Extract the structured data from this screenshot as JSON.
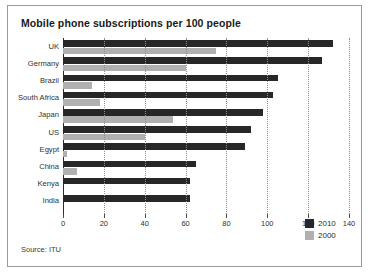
{
  "chart_data": {
    "type": "bar",
    "orientation": "horizontal",
    "title": "Mobile phone subscriptions per 100 people",
    "xlabel": "",
    "ylabel": "",
    "xlim": [
      0,
      140
    ],
    "xticks": [
      0,
      20,
      40,
      60,
      80,
      100,
      120,
      140
    ],
    "grid": true,
    "legend_position": "bottom-right",
    "categories": [
      "UK",
      "Germany",
      "Brazil",
      "South Africa",
      "Japan",
      "US",
      "Egypt",
      "China",
      "Kenya",
      "India"
    ],
    "series": [
      {
        "name": "2010",
        "color": "#272727",
        "values": [
          132,
          127,
          105,
          103,
          98,
          92,
          89,
          65,
          62,
          62
        ]
      },
      {
        "name": "2000",
        "color": "#b0b0b0",
        "values": [
          75,
          60,
          14,
          18,
          54,
          40,
          2,
          7,
          0,
          0
        ]
      }
    ],
    "source": "Source: ITU"
  },
  "legend": {
    "entries": [
      {
        "label": "2010",
        "color": "#272727"
      },
      {
        "label": "2000",
        "color": "#b0b0b0"
      }
    ]
  }
}
